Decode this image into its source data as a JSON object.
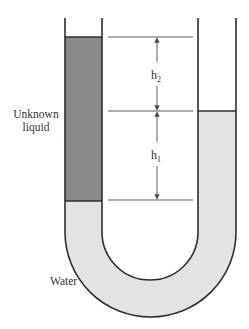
{
  "diagram": {
    "type": "U-tube manometer",
    "labels": {
      "unknown_liquid_line1": "Unknown",
      "unknown_liquid_line2": "liquid",
      "water": "Water",
      "h2_base": "h",
      "h2_sub": "2",
      "h1_base": "h",
      "h1_sub": "1"
    },
    "colors": {
      "unknown_liquid": "#8a8a8a",
      "water": "#e3e3e3",
      "outline": "#2e2e2e",
      "guide_line": "#4a4a4a",
      "background": "#ffffff"
    }
  }
}
